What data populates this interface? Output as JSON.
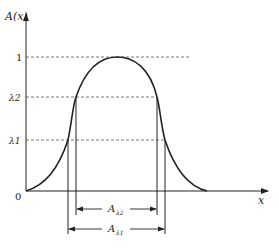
{
  "diagram": {
    "y_axis_label": "A(x)",
    "x_axis_label": "x",
    "origin_label": "0",
    "levels": [
      {
        "label": "1",
        "value": 1
      },
      {
        "label": "λ2",
        "value": 0.7
      },
      {
        "label": "λ1",
        "value": 0.38
      }
    ],
    "intervals": [
      {
        "label": "Aλ2",
        "base": "A",
        "sub": "λ2"
      },
      {
        "label": "Aλ1",
        "base": "A",
        "sub": "λ1"
      }
    ],
    "colors": {
      "line": "#222222",
      "dash": "#555555"
    }
  }
}
